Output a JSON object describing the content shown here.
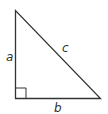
{
  "diagram": {
    "type": "right-triangle",
    "vertices": {
      "top": [
        15.5,
        10.5
      ],
      "bottom_left": [
        15.5,
        98.5
      ],
      "bottom_right": [
        100.5,
        98.5
      ]
    },
    "right_angle_at": "bottom_left",
    "labels": {
      "a": "a",
      "b": "b",
      "c": "c"
    },
    "colors": {
      "stroke": "#333333",
      "background": "#ffffff"
    }
  }
}
